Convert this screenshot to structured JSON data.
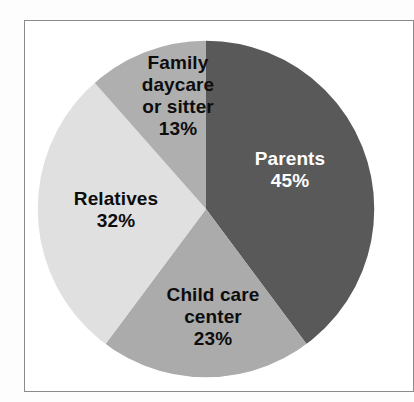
{
  "chart_data": {
    "type": "pie",
    "title": "",
    "subtitle": "",
    "xlabel": "",
    "ylabel": "",
    "legend_position": "none",
    "grid": false,
    "labels_inside_slices": true,
    "start_angle_deg": 0,
    "direction": "clockwise",
    "categories": [
      "Parents",
      "Child care center",
      "Relatives",
      "Family daycare or sitter"
    ],
    "values": [
      45,
      23,
      32,
      13
    ],
    "value_suffix": "%",
    "slices": [
      {
        "name": "Parents",
        "value": 45,
        "value_label": "45%",
        "color": "#595959",
        "text_color": "#ffffff",
        "label_lines": [
          "Parents",
          "45%"
        ]
      },
      {
        "name": "Child care center",
        "value": 23,
        "value_label": "23%",
        "color": "#ababab",
        "text_color": "#0d0d0d",
        "label_lines": [
          "Child care",
          "center",
          "23%"
        ]
      },
      {
        "name": "Relatives",
        "value": 32,
        "value_label": "32%",
        "color": "#e0e0e0",
        "text_color": "#0d0d0d",
        "label_lines": [
          "Relatives",
          "32%"
        ]
      },
      {
        "name": "Family daycare or sitter",
        "value": 13,
        "value_label": "13%",
        "color": "#afafaf",
        "text_color": "#0d0d0d",
        "label_lines": [
          "Family",
          "daycare",
          "or sitter",
          "13%"
        ]
      }
    ]
  },
  "figure": {
    "background_color": "#fdfdfd",
    "frame_color": "#8a8a8a",
    "pie_outline_color": "#ffffff"
  },
  "labels": {
    "parents": {
      "line1": "Parents",
      "line2": "45%"
    },
    "childcare": {
      "line1": "Child care",
      "line2": "center",
      "line3": "23%"
    },
    "relatives": {
      "line1": "Relatives",
      "line2": "32%"
    },
    "family": {
      "line1": "Family",
      "line2": "daycare",
      "line3": "or sitter",
      "line4": "13%"
    }
  }
}
